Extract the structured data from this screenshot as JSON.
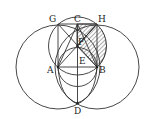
{
  "diagram": {
    "labels": {
      "G": "G",
      "C": "C",
      "H": "H",
      "F": "F",
      "A": "A",
      "E": "E",
      "B": "B",
      "D": "D"
    },
    "stroke_color": "#333333",
    "background": "#ffffff"
  }
}
